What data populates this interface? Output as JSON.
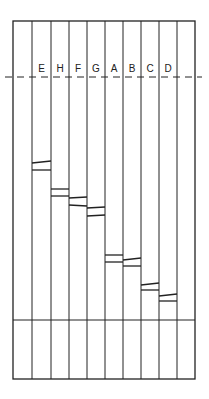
{
  "diagram": {
    "type": "gel-electrophoresis",
    "colors": {
      "line": "#222222",
      "background": "#ffffff"
    },
    "frame": {
      "left": 13,
      "top": 21,
      "right": 195,
      "bottom": 379,
      "well_line_y": 77,
      "lower_divider_y": 320
    },
    "lane_edges": [
      13,
      32,
      51,
      69,
      87,
      105,
      123,
      141,
      159,
      177,
      195
    ],
    "lanes": [
      {
        "label": "",
        "bands": []
      },
      {
        "label": "E",
        "bands": [
          [
            163,
            161
          ],
          [
            170,
            170
          ]
        ]
      },
      {
        "label": "H",
        "bands": [
          [
            189,
            189
          ],
          [
            196,
            196
          ]
        ]
      },
      {
        "label": "F",
        "bands": [
          [
            198,
            197
          ],
          [
            205,
            206
          ]
        ]
      },
      {
        "label": "G",
        "bands": [
          [
            208,
            207
          ],
          [
            216,
            215
          ]
        ]
      },
      {
        "label": "A",
        "bands": [
          [
            255,
            255
          ],
          [
            262,
            262
          ]
        ]
      },
      {
        "label": "B",
        "bands": [
          [
            260,
            258
          ],
          [
            266,
            266
          ]
        ]
      },
      {
        "label": "C",
        "bands": [
          [
            285,
            283
          ],
          [
            290,
            290
          ]
        ]
      },
      {
        "label": "D",
        "bands": [
          [
            296,
            294
          ],
          [
            301,
            301
          ]
        ]
      },
      {
        "label": "",
        "bands": []
      }
    ]
  }
}
